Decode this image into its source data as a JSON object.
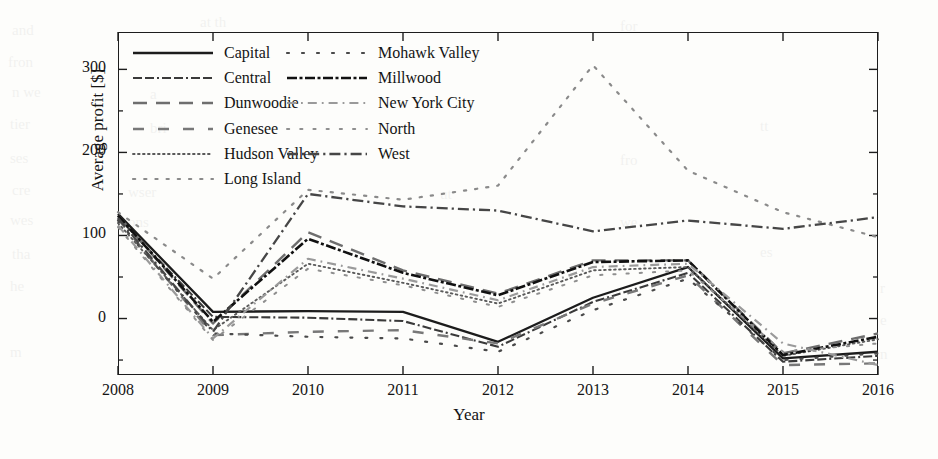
{
  "chart_data": {
    "type": "line",
    "title": "",
    "xlabel": "Year",
    "ylabel": "Average profit [$]",
    "x": [
      2008,
      2009,
      2010,
      2011,
      2012,
      2013,
      2014,
      2015,
      2016
    ],
    "xticklabels": [
      "2008",
      "2009",
      "2010",
      "2011",
      "2012",
      "2013",
      "2014",
      "2015",
      "2016"
    ],
    "yticklabels": [
      "0",
      "100",
      "200",
      "300"
    ],
    "yticks": [
      0,
      100,
      200,
      300
    ],
    "xlim": [
      2008,
      2016
    ],
    "ylim": [
      -68,
      345
    ],
    "grid": false,
    "legend_position": "upper-left-inside",
    "legend_columns": 2,
    "series": [
      {
        "name": "Capital",
        "style": "solid",
        "color": "#1c1c1c",
        "width": 2.3,
        "values": [
          126,
          8,
          9,
          8,
          -28,
          25,
          62,
          -48,
          -40
        ]
      },
      {
        "name": "Central",
        "style": "dashdotdot",
        "color": "#3a3a3a",
        "width": 2.1,
        "values": [
          122,
          2,
          1,
          -3,
          -34,
          20,
          55,
          -52,
          -45
        ]
      },
      {
        "name": "Dunwoodie",
        "style": "longdash",
        "color": "#6e6e6e",
        "width": 2.4,
        "values": [
          124,
          -6,
          104,
          58,
          30,
          70,
          70,
          -42,
          -18
        ]
      },
      {
        "name": "Genesee",
        "style": "widedash",
        "color": "#787878",
        "width": 2.4,
        "values": [
          120,
          -20,
          -16,
          -14,
          -30,
          18,
          52,
          -56,
          -54
        ]
      },
      {
        "name": "Hudson Valley",
        "style": "finedot",
        "color": "#5a5a5a",
        "width": 1.9,
        "values": [
          115,
          -14,
          66,
          43,
          18,
          58,
          62,
          -45,
          -25
        ]
      },
      {
        "name": "Long Island",
        "style": "sparsedot",
        "color": "#8a8a8a",
        "width": 2.2,
        "values": [
          128,
          48,
          155,
          143,
          160,
          305,
          178,
          128,
          98
        ]
      },
      {
        "name": "Mohawk Valley",
        "style": "widedot",
        "color": "#4a4a4a",
        "width": 2.2,
        "values": [
          118,
          -18,
          -22,
          -24,
          -40,
          10,
          48,
          -50,
          -42
        ]
      },
      {
        "name": "Millwood",
        "style": "densedashdot",
        "color": "#111111",
        "width": 2.6,
        "values": [
          124,
          -4,
          96,
          55,
          28,
          68,
          70,
          -44,
          -22
        ]
      },
      {
        "name": "New York City",
        "style": "lightdashdot",
        "color": "#9a9a9a",
        "width": 2.2,
        "values": [
          112,
          -24,
          72,
          48,
          22,
          62,
          66,
          -30,
          -56
        ]
      },
      {
        "name": "North",
        "style": "spacedot",
        "color": "#8f8f8f",
        "width": 2.0,
        "values": [
          110,
          -26,
          60,
          40,
          14,
          52,
          58,
          -40,
          -30
        ]
      },
      {
        "name": "West",
        "style": "dashdot",
        "color": "#464646",
        "width": 2.3,
        "values": [
          121,
          -16,
          150,
          135,
          130,
          105,
          118,
          108,
          122
        ]
      }
    ]
  },
  "bleed_text": [
    {
      "x": 12,
      "y": 22,
      "t": "and"
    },
    {
      "x": 200,
      "y": 14,
      "t": "at th"
    },
    {
      "x": 620,
      "y": 18,
      "t": "for"
    },
    {
      "x": 8,
      "y": 54,
      "t": "fron"
    },
    {
      "x": 12,
      "y": 84,
      "t": "n we"
    },
    {
      "x": 150,
      "y": 86,
      "t": "a"
    },
    {
      "x": 10,
      "y": 116,
      "t": "tier"
    },
    {
      "x": 150,
      "y": 120,
      "t": "bri"
    },
    {
      "x": 760,
      "y": 118,
      "t": "tt"
    },
    {
      "x": 10,
      "y": 150,
      "t": "ses"
    },
    {
      "x": 620,
      "y": 152,
      "t": "fro"
    },
    {
      "x": 12,
      "y": 182,
      "t": "cre"
    },
    {
      "x": 128,
      "y": 184,
      "t": "wser"
    },
    {
      "x": 440,
      "y": 186,
      "t": "ut"
    },
    {
      "x": 10,
      "y": 212,
      "t": "wes"
    },
    {
      "x": 128,
      "y": 214,
      "t": "ons"
    },
    {
      "x": 620,
      "y": 214,
      "t": "we"
    },
    {
      "x": 12,
      "y": 246,
      "t": "tha"
    },
    {
      "x": 760,
      "y": 244,
      "t": "es"
    },
    {
      "x": 10,
      "y": 278,
      "t": "he"
    },
    {
      "x": 880,
      "y": 280,
      "t": "r"
    },
    {
      "x": 880,
      "y": 312,
      "t": "e"
    },
    {
      "x": 10,
      "y": 344,
      "t": "m"
    },
    {
      "x": 880,
      "y": 346,
      "t": "n"
    }
  ]
}
